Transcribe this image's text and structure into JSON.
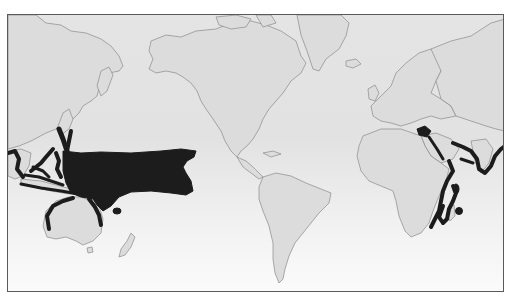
{
  "map": {
    "type": "world-distribution-map",
    "projection": "Mercator, Americas-centered",
    "style": "grayscale",
    "colors": {
      "ocean": "#e2e2e2",
      "land": "#dcdcdc",
      "coastline": "#8a8a8a",
      "distribution_range": "#1c1c1c",
      "frame": "#5a5a5a"
    },
    "regions_shown": [
      "North America",
      "South America",
      "Greenland",
      "Europe",
      "Africa",
      "Asia",
      "Australia",
      "New Zealand",
      "Pacific Ocean",
      "Atlantic Ocean",
      "Indian Ocean"
    ],
    "highlighted_ranges": [
      "Western & central tropical Pacific (large shaded area)",
      "Southern Japan coast",
      "Indonesia, Philippines & New Guinea coasts",
      "Northern Australia coast",
      "Red Sea / Persian Gulf region",
      "Indian & Southeast Asian coast",
      "East African coast & Madagascar",
      "Mascarene Islands"
    ]
  }
}
